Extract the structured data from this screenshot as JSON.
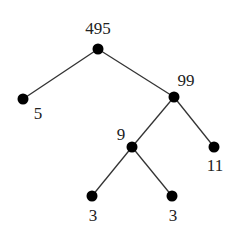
{
  "diagram": {
    "type": "factor-tree",
    "colors": {
      "line": "#333333",
      "node": "#000000",
      "text": "#222222",
      "background": "#ffffff"
    },
    "nodes": [
      {
        "id": "n495",
        "label": "495",
        "x": 98,
        "y": 49,
        "lx": 98,
        "ly": 34,
        "anchor": "middle"
      },
      {
        "id": "n5",
        "label": "5",
        "x": 23,
        "y": 99,
        "lx": 38,
        "ly": 119,
        "anchor": "middle"
      },
      {
        "id": "n99",
        "label": "99",
        "x": 174,
        "y": 97,
        "lx": 186,
        "ly": 86,
        "anchor": "middle"
      },
      {
        "id": "n9",
        "label": "9",
        "x": 132,
        "y": 147,
        "lx": 121,
        "ly": 140,
        "anchor": "middle"
      },
      {
        "id": "n11",
        "label": "11",
        "x": 214,
        "y": 147,
        "lx": 215,
        "ly": 171,
        "anchor": "middle"
      },
      {
        "id": "n3a",
        "label": "3",
        "x": 92,
        "y": 196,
        "lx": 93,
        "ly": 221,
        "anchor": "middle"
      },
      {
        "id": "n3b",
        "label": "3",
        "x": 172,
        "y": 196,
        "lx": 173,
        "ly": 221,
        "anchor": "middle"
      }
    ],
    "edges": [
      [
        "n495",
        "n5"
      ],
      [
        "n495",
        "n99"
      ],
      [
        "n99",
        "n9"
      ],
      [
        "n99",
        "n11"
      ],
      [
        "n9",
        "n3a"
      ],
      [
        "n9",
        "n3b"
      ]
    ]
  }
}
